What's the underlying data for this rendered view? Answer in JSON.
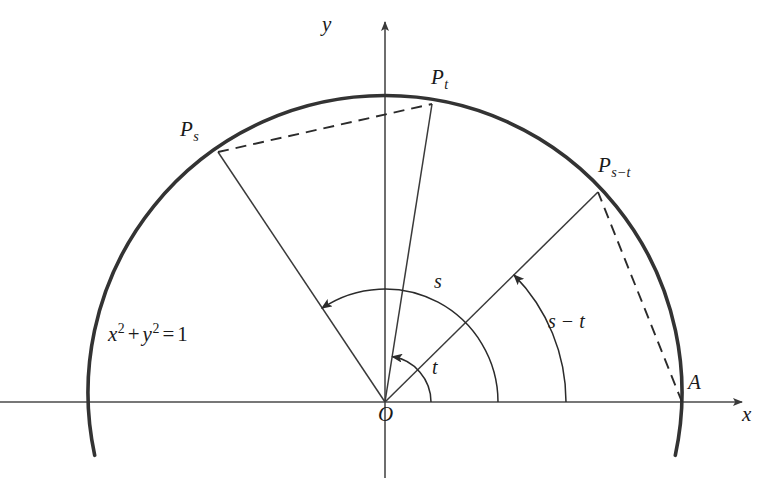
{
  "figure": {
    "background_color": "#ffffff",
    "stroke_color": "#2b2b2b",
    "circle_color": "#333333",
    "axis_color": "#4a4a4a"
  },
  "axes": {
    "x_label": "x",
    "y_label": "y",
    "origin_label": "O"
  },
  "points": [
    {
      "id": "Ps",
      "base": "P",
      "subscript": "s",
      "x": 218,
      "y": 152,
      "angle_deg": 124,
      "label_x": 180,
      "label_y": 119
    },
    {
      "id": "Pt",
      "base": "P",
      "subscript": "t",
      "x": 432,
      "y": 104,
      "angle_deg": 81,
      "label_x": 431,
      "label_y": 67
    },
    {
      "id": "Pst",
      "base": "P",
      "subscript": "s−t",
      "x": 598,
      "y": 192,
      "angle_deg": 44.6,
      "label_x": 598,
      "label_y": 155
    },
    {
      "id": "A",
      "base": "A",
      "subscript": "",
      "x": 682,
      "y": 402,
      "angle_deg": 0,
      "label_x": 688,
      "label_y": 372
    }
  ],
  "angle_arcs": [
    {
      "id": "t",
      "label": "t",
      "radius": 46,
      "from_deg": 0,
      "to_deg": 81,
      "label_x": 432,
      "label_y": 357
    },
    {
      "id": "s",
      "label": "s",
      "radius": 113,
      "from_deg": 0,
      "to_deg": 124,
      "label_x": 434,
      "label_y": 271
    },
    {
      "id": "s-t",
      "label": "s − t",
      "radius": 181,
      "from_deg": 0,
      "to_deg": 44.6,
      "label_x": 548,
      "label_y": 311
    }
  ],
  "equation": {
    "text": "x² + y² = 1",
    "var1": "x",
    "exp1": "2",
    "plus": "+",
    "var2": "y",
    "exp2": "2",
    "equals": "=",
    "value": "1",
    "label_x": 108,
    "label_y": 322
  },
  "chords": [
    {
      "id": "chord-Ps-Pt",
      "style": "dashed",
      "from": "Ps",
      "to": "Pt"
    },
    {
      "id": "chord-A-Pst",
      "style": "dashed",
      "from": "A",
      "to": "Pst"
    }
  ],
  "radii": [
    {
      "id": "radius-Ps",
      "to": "Ps"
    },
    {
      "id": "radius-Pt",
      "to": "Pt"
    },
    {
      "id": "radius-Pst",
      "to": "Pst"
    }
  ],
  "geometry": {
    "center_x": 385,
    "center_y": 402,
    "radius": 297
  }
}
